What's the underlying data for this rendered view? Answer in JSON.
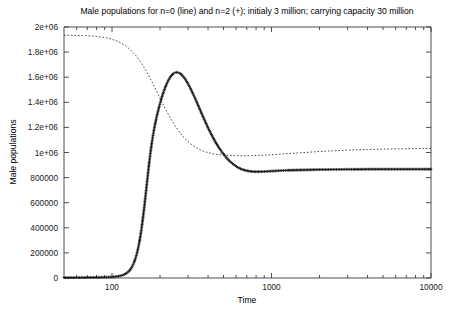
{
  "chart_data": {
    "type": "line",
    "title": "Male populations for n=0 (line) and n=2 (+); initialy 3 million; carrying capacity 30 million",
    "xlabel": "Time",
    "ylabel": "Male populations",
    "xscale": "log",
    "yscale": "linear",
    "xlim": [
      50,
      10000
    ],
    "ylim": [
      0,
      2000000
    ],
    "grid": false,
    "legend": "none",
    "xticks": [
      {
        "value": 100,
        "label": "100"
      },
      {
        "value": 1000,
        "label": "1000"
      },
      {
        "value": 10000,
        "label": "10000"
      }
    ],
    "xminor": [
      60,
      70,
      80,
      90,
      200,
      300,
      400,
      500,
      600,
      700,
      800,
      900,
      2000,
      3000,
      4000,
      5000,
      6000,
      7000,
      8000,
      9000
    ],
    "yticks": [
      {
        "value": 0,
        "label": "0"
      },
      {
        "value": 200000,
        "label": "200000"
      },
      {
        "value": 400000,
        "label": "400000"
      },
      {
        "value": 600000,
        "label": "600000"
      },
      {
        "value": 800000,
        "label": "800000"
      },
      {
        "value": 1000000,
        "label": "1e+06"
      },
      {
        "value": 1200000,
        "label": "1.2e+06"
      },
      {
        "value": 1400000,
        "label": "1.4e+06"
      },
      {
        "value": 1600000,
        "label": "1.6e+06"
      },
      {
        "value": 1800000,
        "label": "1.8e+06"
      },
      {
        "value": 2000000,
        "label": "2e+06"
      }
    ],
    "series": [
      {
        "name": "n=0 (line)",
        "style": "dotted-line",
        "color": "#2b2b2b",
        "points": [
          [
            50,
            1935000
          ],
          [
            55,
            1934000
          ],
          [
            60,
            1933000
          ],
          [
            65,
            1932000
          ],
          [
            70,
            1930000
          ],
          [
            75,
            1928000
          ],
          [
            80,
            1925000
          ],
          [
            85,
            1921000
          ],
          [
            90,
            1916000
          ],
          [
            95,
            1910000
          ],
          [
            100,
            1902000
          ],
          [
            110,
            1882000
          ],
          [
            120,
            1855000
          ],
          [
            130,
            1820000
          ],
          [
            140,
            1778000
          ],
          [
            150,
            1728000
          ],
          [
            160,
            1672000
          ],
          [
            170,
            1612000
          ],
          [
            180,
            1551000
          ],
          [
            190,
            1490000
          ],
          [
            200,
            1432000
          ],
          [
            215,
            1352000
          ],
          [
            230,
            1283000
          ],
          [
            245,
            1224000
          ],
          [
            260,
            1176000
          ],
          [
            280,
            1124000
          ],
          [
            300,
            1086000
          ],
          [
            320,
            1057000
          ],
          [
            340,
            1036000
          ],
          [
            360,
            1020000
          ],
          [
            380,
            1008000
          ],
          [
            400,
            999000
          ],
          [
            430,
            990000
          ],
          [
            460,
            984000
          ],
          [
            500,
            979000
          ],
          [
            550,
            976000
          ],
          [
            600,
            974000
          ],
          [
            700,
            974000
          ],
          [
            800,
            976000
          ],
          [
            900,
            979000
          ],
          [
            1000,
            982000
          ],
          [
            1200,
            989000
          ],
          [
            1400,
            995000
          ],
          [
            1700,
            1002000
          ],
          [
            2000,
            1008000
          ],
          [
            2500,
            1014000
          ],
          [
            3000,
            1019000
          ],
          [
            4000,
            1024000
          ],
          [
            5000,
            1027000
          ],
          [
            6000,
            1029000
          ],
          [
            8000,
            1031000
          ],
          [
            10000,
            1032000
          ]
        ]
      },
      {
        "name": "n=2 (+)",
        "style": "plus-markers",
        "color": "#111111",
        "points": [
          [
            50,
            3000
          ],
          [
            60,
            3400
          ],
          [
            70,
            4000
          ],
          [
            80,
            4900
          ],
          [
            90,
            6300
          ],
          [
            95,
            7400
          ],
          [
            100,
            8800
          ],
          [
            105,
            11000
          ],
          [
            110,
            14500
          ],
          [
            115,
            20000
          ],
          [
            120,
            29000
          ],
          [
            124,
            40000
          ],
          [
            128,
            56000
          ],
          [
            131,
            72000
          ],
          [
            134,
            93000
          ],
          [
            137,
            120000
          ],
          [
            140,
            152000
          ],
          [
            143,
            192000
          ],
          [
            146,
            240000
          ],
          [
            148,
            278000
          ],
          [
            150,
            320000
          ],
          [
            152,
            366000
          ],
          [
            154,
            416000
          ],
          [
            156,
            470000
          ],
          [
            158,
            527000
          ],
          [
            160,
            586000
          ],
          [
            162,
            647000
          ],
          [
            164,
            709000
          ],
          [
            166,
            770000
          ],
          [
            168,
            830000
          ],
          [
            170,
            888000
          ],
          [
            172,
            942000
          ],
          [
            174,
            993000
          ],
          [
            176,
            1040000
          ],
          [
            178,
            1083000
          ],
          [
            180,
            1122000
          ],
          [
            183,
            1175000
          ],
          [
            186,
            1222000
          ],
          [
            189,
            1264000
          ],
          [
            192,
            1302000
          ],
          [
            195,
            1337000
          ],
          [
            198,
            1370000
          ],
          [
            202,
            1410000
          ],
          [
            206,
            1446000
          ],
          [
            210,
            1479000
          ],
          [
            215,
            1515000
          ],
          [
            220,
            1546000
          ],
          [
            225,
            1572000
          ],
          [
            230,
            1594000
          ],
          [
            236,
            1614000
          ],
          [
            242,
            1628000
          ],
          [
            248,
            1636000
          ],
          [
            254,
            1639000
          ],
          [
            260,
            1637000
          ],
          [
            267,
            1630000
          ],
          [
            274,
            1618000
          ],
          [
            282,
            1600000
          ],
          [
            290,
            1578000
          ],
          [
            300,
            1547000
          ],
          [
            310,
            1512000
          ],
          [
            322,
            1468000
          ],
          [
            335,
            1420000
          ],
          [
            350,
            1364000
          ],
          [
            365,
            1310000
          ],
          [
            382,
            1253000
          ],
          [
            400,
            1197000
          ],
          [
            420,
            1143000
          ],
          [
            442,
            1091000
          ],
          [
            465,
            1044000
          ],
          [
            490,
            1002000
          ],
          [
            518,
            963000
          ],
          [
            548,
            930000
          ],
          [
            580,
            903000
          ],
          [
            615,
            881000
          ],
          [
            652,
            866000
          ],
          [
            692,
            856000
          ],
          [
            735,
            850000
          ],
          [
            780,
            847000
          ],
          [
            830,
            847000
          ],
          [
            885,
            848000
          ],
          [
            945,
            850000
          ],
          [
            1010,
            852000
          ],
          [
            1080,
            854000
          ],
          [
            1160,
            856000
          ],
          [
            1250,
            858000
          ],
          [
            1350,
            859000
          ],
          [
            1460,
            860000
          ],
          [
            1580,
            861000
          ],
          [
            1720,
            862000
          ],
          [
            1870,
            863000
          ],
          [
            2040,
            864000
          ],
          [
            2230,
            864000
          ],
          [
            2440,
            865000
          ],
          [
            2680,
            865000
          ],
          [
            2950,
            866000
          ],
          [
            3250,
            866000
          ],
          [
            3590,
            866000
          ],
          [
            3970,
            867000
          ],
          [
            4400,
            867000
          ],
          [
            4880,
            867000
          ],
          [
            5420,
            867000
          ],
          [
            6030,
            867000
          ],
          [
            6710,
            867000
          ],
          [
            7470,
            867000
          ],
          [
            8320,
            867000
          ],
          [
            9270,
            867000
          ],
          [
            10000,
            867000
          ]
        ]
      }
    ]
  },
  "plot_geometry": {
    "left": 64,
    "right": 431,
    "top": 27,
    "bottom": 278
  }
}
